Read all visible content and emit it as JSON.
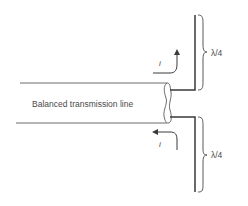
{
  "diagram": {
    "line_label": "Balanced transmission line",
    "current_label_top": "i",
    "current_label_bottom": "i",
    "length_label_top": "λ/4",
    "length_label_bottom": "λ/4",
    "colors": {
      "stroke": "#3a3a3a",
      "text": "#4a4a4a",
      "background": "#ffffff"
    }
  }
}
